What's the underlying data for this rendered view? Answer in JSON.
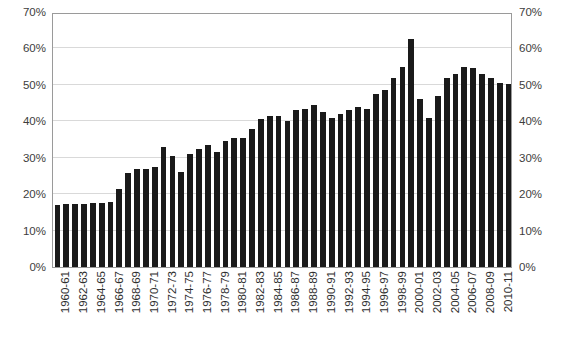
{
  "chart_data": {
    "type": "bar",
    "title": "",
    "subtitle": "",
    "xlabel": "",
    "ylabel": "",
    "ylim": [
      0,
      70
    ],
    "y_unit": "%",
    "grid": true,
    "legend": "none",
    "dual_y_axis": true,
    "bar_color": "#1a1a1a",
    "y_ticks": [
      {
        "value": 0,
        "label": "0%"
      },
      {
        "value": 10,
        "label": "10%"
      },
      {
        "value": 20,
        "label": "20%"
      },
      {
        "value": 30,
        "label": "30%"
      },
      {
        "value": 40,
        "label": "40%"
      },
      {
        "value": 50,
        "label": "50%"
      },
      {
        "value": 60,
        "label": "60%"
      },
      {
        "value": 70,
        "label": "70%"
      }
    ],
    "y_ticks_right": [
      {
        "value": 0,
        "label": "0%"
      },
      {
        "value": 10,
        "label": "10%"
      },
      {
        "value": 20,
        "label": "20%"
      },
      {
        "value": 30,
        "label": "30%"
      },
      {
        "value": 40,
        "label": "40%"
      },
      {
        "value": 50,
        "label": "50%"
      },
      {
        "value": 60,
        "label": "60%"
      },
      {
        "value": 70,
        "label": "70%"
      }
    ],
    "categories": [
      "1960-61",
      "1961-62",
      "1962-63",
      "1963-64",
      "1964-65",
      "1965-66",
      "1966-67",
      "1967-68",
      "1968-69",
      "1969-70",
      "1970-71",
      "1971-72",
      "1972-73",
      "1973-74",
      "1974-75",
      "1975-76",
      "1976-77",
      "1977-78",
      "1978-79",
      "1979-80",
      "1980-81",
      "1981-82",
      "1982-83",
      "1983-84",
      "1984-85",
      "1985-86",
      "1986-87",
      "1987-88",
      "1988-89",
      "1989-90",
      "1990-91",
      "1991-92",
      "1992-93",
      "1993-94",
      "1994-95",
      "1995-96",
      "1996-97",
      "1997-98",
      "1998-99",
      "1999-00",
      "2000-01",
      "2001-02",
      "2002-03",
      "2003-04",
      "2004-05",
      "2005-06",
      "2006-07",
      "2007-08",
      "2008-09",
      "2009-10",
      "2010-11",
      "2011-12"
    ],
    "values": [
      17.0,
      17.3,
      17.4,
      17.4,
      17.5,
      17.6,
      17.9,
      21.5,
      25.9,
      26.8,
      27.0,
      27.5,
      33.0,
      30.5,
      26.2,
      31.0,
      32.5,
      33.5,
      31.5,
      34.5,
      35.5,
      35.5,
      38.0,
      40.5,
      41.5,
      41.5,
      40.0,
      43.0,
      43.5,
      44.5,
      42.5,
      41.0,
      42.0,
      43.0,
      44.0,
      43.5,
      47.5,
      48.5,
      52.0,
      55.0,
      62.5,
      46.0,
      41.0,
      47.0,
      52.0,
      53.0,
      55.0,
      54.5,
      53.0,
      52.0,
      50.5,
      50.3
    ],
    "tick_label_interval": 2,
    "visible_tick_labels": [
      "1960-61",
      "1962-63",
      "1964-65",
      "1966-67",
      "1968-69",
      "1970-71",
      "1972-73",
      "1974-75",
      "1976-77",
      "1978-79",
      "1980-81",
      "1982-83",
      "1984-85",
      "1986-87",
      "1988-89",
      "1990-91",
      "1992-93",
      "1994-95",
      "1996-97",
      "1998-99",
      "2000-01",
      "2002-03",
      "2004-05",
      "2006-07",
      "2008-09",
      "2010-11"
    ]
  }
}
